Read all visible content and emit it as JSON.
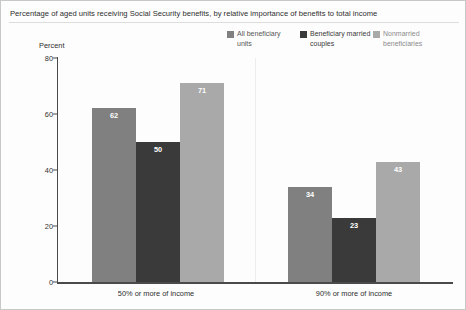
{
  "chart_data": {
    "type": "bar",
    "title": "Percentage of aged units receiving Social Security benefits, by relative importance of benefits to total income",
    "xlabel": "",
    "ylabel": "Percent",
    "ylim": [
      0,
      80
    ],
    "yticks": [
      0,
      20,
      40,
      60,
      80
    ],
    "grid": false,
    "legend_position": "top-right",
    "categories": [
      "50% or more of income",
      "90% or more of income"
    ],
    "series": [
      {
        "name": "All beneficiary units",
        "color": "#808080",
        "values": [
          62,
          34
        ]
      },
      {
        "name": "Beneficiary married couples",
        "color": "#3a3a3a",
        "values": [
          50,
          23
        ]
      },
      {
        "name": "Nonmarried beneficiaries",
        "color": "#a9a9a9",
        "values": [
          71,
          43
        ]
      }
    ]
  },
  "legend": {
    "items": [
      {
        "label": "All beneficiary units",
        "color": "#808080"
      },
      {
        "label": "Beneficiary married couples",
        "color": "#3a3a3a"
      },
      {
        "label": "Nonmarried beneficiaries",
        "color": "#a9a9a9"
      }
    ]
  },
  "axis": {
    "y_label": "Percent",
    "y_ticks": [
      "0",
      "20",
      "40",
      "60",
      "80"
    ],
    "x_categories": [
      "50% or more of income",
      "90% or more of income"
    ]
  }
}
